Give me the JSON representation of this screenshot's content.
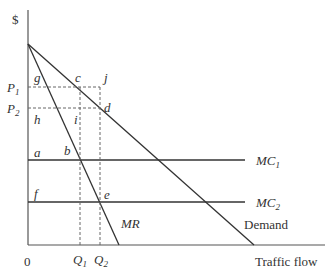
{
  "diagram": {
    "type": "economics-monopoly-pricing",
    "y_axis_label": "$",
    "x_axis_label": "Traffic flow",
    "origin_label": "0",
    "price_labels": {
      "p1": {
        "base": "P",
        "sub": "1"
      },
      "p2": {
        "base": "P",
        "sub": "2"
      }
    },
    "quantity_labels": {
      "q1": {
        "base": "Q",
        "sub": "1"
      },
      "q2": {
        "base": "Q",
        "sub": "2"
      }
    },
    "curves": {
      "demand": "Demand",
      "mr": "MR",
      "mc1": {
        "base": "MC",
        "sub": "1"
      },
      "mc2": {
        "base": "MC",
        "sub": "2"
      }
    },
    "points": {
      "a": "a",
      "b": "b",
      "c": "c",
      "d": "d",
      "e": "e",
      "f": "f",
      "g": "g",
      "h": "h",
      "i": "i",
      "j": "j"
    }
  }
}
